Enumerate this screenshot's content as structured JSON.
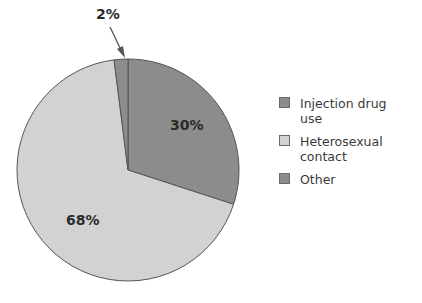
{
  "chart_data": {
    "type": "pie",
    "title": "",
    "categories": [
      "Injection drug use",
      "Heterosexual contact",
      "Other"
    ],
    "values": [
      30,
      68,
      2
    ],
    "labels": [
      "30%",
      "68%",
      "2%"
    ],
    "colors": [
      "#8c8c8c",
      "#d2d2d2",
      "#8c8c8c"
    ],
    "start_angle_deg": 0,
    "direction": "clockwise",
    "annotations": [
      {
        "text": "2%",
        "type": "arrow",
        "target": "Other"
      }
    ],
    "legend_position": "right"
  },
  "legend": {
    "items": [
      {
        "label": "Injection drug use",
        "color": "#8c8c8c"
      },
      {
        "label": "Heterosexual contact",
        "color": "#d2d2d2"
      },
      {
        "label": "Other",
        "color": "#8c8c8c"
      }
    ]
  }
}
